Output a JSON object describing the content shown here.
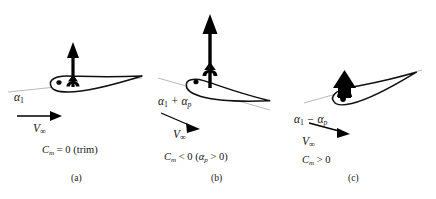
{
  "figure": {
    "type": "diagram",
    "background_color": "#ffffff",
    "ink_color": "#000000",
    "chord_line_color": "#9a9a9a",
    "panel_count": 3
  },
  "panels": [
    {
      "id": "a",
      "sub_label": "(a)",
      "angle_of_attack_label": "α",
      "angle_of_attack_sub": "1",
      "angle_of_attack_full": "α₁",
      "freestream_label": "V",
      "freestream_sub": "∞",
      "freestream_full": "V∞",
      "moment_condition": "C",
      "moment_sub": "m",
      "moment_rest": " = 0 (trim)",
      "moment_full": "Cm = 0 (trim)",
      "incidence_deg": 0,
      "lift_arrow_length": 42,
      "lift_arrow_thickness": "medium",
      "moment_symbol": "small-up-arrow-with-curl",
      "description": "Airfoil at trim incidence, chord aligned with freestream, zero pitching moment"
    },
    {
      "id": "b",
      "sub_label": "(b)",
      "angle_of_attack_label": "α",
      "angle_of_attack_sub": "1",
      "angle_of_attack_plus": " + ",
      "angle_of_attack_label2": "α",
      "angle_of_attack_sub2": "p",
      "angle_of_attack_full": "α₁ + αp",
      "freestream_label": "V",
      "freestream_sub": "∞",
      "freestream_full": "V∞",
      "moment_condition": "C",
      "moment_sub": "m",
      "moment_rest": " < 0 (",
      "moment_alpha": "α",
      "moment_alpha_sub": "p",
      "moment_tail": " > 0)",
      "moment_full": "Cm < 0 (αp > 0)",
      "incidence_deg": 18,
      "lift_arrow_length": 76,
      "lift_arrow_thickness": "medium",
      "moment_symbol": "small-up-arrow-with-curl",
      "description": "Airfoil at increased incidence, nose up, larger lift, negative (nose-down) pitching moment"
    },
    {
      "id": "c",
      "sub_label": "(c)",
      "angle_of_attack_label": "α",
      "angle_of_attack_sub": "1",
      "angle_of_attack_minus": " − ",
      "angle_of_attack_label2": "α",
      "angle_of_attack_sub2": "p",
      "angle_of_attack_full": "α₁ − αp",
      "freestream_label": "V",
      "freestream_sub": "∞",
      "freestream_full": "V∞",
      "moment_condition": "C",
      "moment_sub": "m",
      "moment_rest": " > 0",
      "moment_full": "Cm > 0",
      "incidence_deg": -14,
      "lift_arrow_length": 20,
      "lift_arrow_thickness": "thick-short",
      "moment_symbol": "small-up-arrow-with-curl",
      "description": "Airfoil at reduced incidence, nose down, small lift, positive (nose-up) pitching moment"
    }
  ]
}
